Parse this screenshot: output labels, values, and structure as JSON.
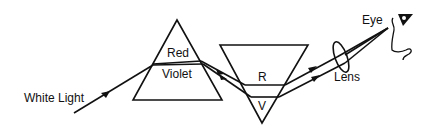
{
  "diagram": {
    "labels": {
      "white_light": "White Light",
      "red": "Red",
      "violet": "Violet",
      "r": "R",
      "v": "V",
      "lens": "Lens",
      "eye": "Eye"
    },
    "icons": [
      "eye-icon",
      "face-profile-icon",
      "arrow-icon"
    ],
    "colors": {
      "line": "#111111",
      "background": "#ffffff"
    }
  }
}
